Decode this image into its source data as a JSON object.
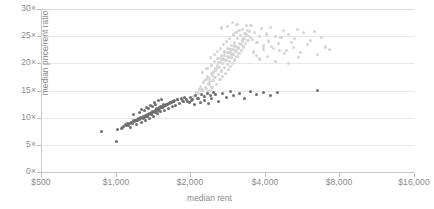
{
  "chart_data": {
    "type": "scatter",
    "title": "",
    "xlabel": "median rent",
    "ylabel": "median price/rent ratio",
    "xscale": "log2",
    "xlim": [
      500,
      16000
    ],
    "ylim": [
      0,
      30
    ],
    "xticks": [
      500,
      1000,
      2000,
      4000,
      8000,
      16000
    ],
    "xtick_labels": [
      "$500",
      "$1,000",
      "$2,000",
      "$4,000",
      "$8,000",
      "$16,000"
    ],
    "yticks": [
      0,
      5,
      10,
      15,
      20,
      25,
      30
    ],
    "ytick_labels": [
      "0×",
      "5×",
      "10×",
      "15×",
      "20×",
      "25×",
      "30×"
    ],
    "grid": true,
    "legend": "none",
    "colors": {
      "light_series": "#d5d5d5",
      "dark_series": "#6f6f6f",
      "grid": "#e8e8e8",
      "axis": "#c9c9c9",
      "text": "#8a8a8a"
    },
    "series": [
      {
        "name": "light-series",
        "color": "#d5d5d5",
        "points": [
          [
            2150,
            14.4
          ],
          [
            2230,
            15.1
          ],
          [
            2300,
            15.6
          ],
          [
            2380,
            16.2
          ],
          [
            2420,
            15.0
          ],
          [
            2470,
            16.8
          ],
          [
            2520,
            17.4
          ],
          [
            2560,
            16.1
          ],
          [
            2600,
            18.0
          ],
          [
            2640,
            17.0
          ],
          [
            2680,
            18.6
          ],
          [
            2710,
            17.6
          ],
          [
            2750,
            19.2
          ],
          [
            2780,
            18.2
          ],
          [
            2820,
            19.8
          ],
          [
            2850,
            18.8
          ],
          [
            2880,
            20.4
          ],
          [
            2910,
            19.4
          ],
          [
            2940,
            21.0
          ],
          [
            2970,
            20.0
          ],
          [
            3000,
            21.6
          ],
          [
            3030,
            20.6
          ],
          [
            3060,
            22.2
          ],
          [
            3090,
            21.2
          ],
          [
            3120,
            22.8
          ],
          [
            3150,
            21.8
          ],
          [
            3180,
            23.4
          ],
          [
            3210,
            22.4
          ],
          [
            3240,
            24.0
          ],
          [
            3270,
            23.0
          ],
          [
            3300,
            24.6
          ],
          [
            3340,
            23.6
          ],
          [
            3380,
            25.2
          ],
          [
            3420,
            24.2
          ],
          [
            3460,
            25.8
          ],
          [
            3500,
            24.8
          ],
          [
            2280,
            16.9
          ],
          [
            2350,
            17.5
          ],
          [
            2440,
            18.1
          ],
          [
            2530,
            18.7
          ],
          [
            2620,
            19.3
          ],
          [
            2700,
            19.9
          ],
          [
            2790,
            20.5
          ],
          [
            2870,
            21.1
          ],
          [
            2950,
            21.7
          ],
          [
            3040,
            22.3
          ],
          [
            3130,
            22.9
          ],
          [
            3220,
            23.5
          ],
          [
            2200,
            15.8
          ],
          [
            2260,
            16.4
          ],
          [
            2330,
            17.0
          ],
          [
            2400,
            17.2
          ],
          [
            2460,
            17.8
          ],
          [
            2540,
            19.0
          ],
          [
            2610,
            20.2
          ],
          [
            2690,
            20.8
          ],
          [
            2760,
            21.4
          ],
          [
            2840,
            22.0
          ],
          [
            2920,
            22.6
          ],
          [
            3010,
            23.2
          ],
          [
            2320,
            15.4
          ],
          [
            2390,
            16.6
          ],
          [
            2480,
            18.4
          ],
          [
            2570,
            19.6
          ],
          [
            2660,
            20.1
          ],
          [
            2740,
            20.7
          ],
          [
            2830,
            21.3
          ],
          [
            2900,
            21.9
          ],
          [
            2990,
            22.5
          ],
          [
            3070,
            23.1
          ],
          [
            3160,
            23.7
          ],
          [
            3250,
            24.3
          ],
          [
            2250,
            18.3
          ],
          [
            2340,
            19.1
          ],
          [
            2430,
            19.7
          ],
          [
            2510,
            20.3
          ],
          [
            2590,
            20.9
          ],
          [
            2670,
            21.5
          ],
          [
            2760,
            22.1
          ],
          [
            2840,
            22.7
          ],
          [
            2930,
            23.3
          ],
          [
            3020,
            23.9
          ],
          [
            3110,
            24.5
          ],
          [
            3200,
            25.1
          ],
          [
            2410,
            21.0
          ],
          [
            2500,
            21.6
          ],
          [
            2580,
            22.2
          ],
          [
            2650,
            22.8
          ],
          [
            2730,
            23.4
          ],
          [
            2810,
            24.0
          ],
          [
            2890,
            24.6
          ],
          [
            2980,
            25.2
          ],
          [
            3060,
            25.7
          ],
          [
            3150,
            26.0
          ],
          [
            3240,
            26.3
          ],
          [
            3330,
            25.5
          ],
          [
            3400,
            26.1
          ],
          [
            3480,
            25.0
          ],
          [
            3560,
            24.4
          ],
          [
            3640,
            25.6
          ],
          [
            3720,
            23.8
          ],
          [
            3800,
            24.9
          ],
          [
            3880,
            26.4
          ],
          [
            3960,
            23.2
          ],
          [
            4050,
            25.4
          ],
          [
            4140,
            24.1
          ],
          [
            4230,
            26.6
          ],
          [
            4330,
            22.8
          ],
          [
            4430,
            25.0
          ],
          [
            4540,
            23.6
          ],
          [
            4650,
            24.7
          ],
          [
            4760,
            26.0
          ],
          [
            4880,
            22.4
          ],
          [
            5000,
            25.3
          ],
          [
            5130,
            23.9
          ],
          [
            5270,
            24.5
          ],
          [
            5420,
            26.2
          ],
          [
            5580,
            22.0
          ],
          [
            5750,
            25.7
          ],
          [
            5930,
            23.4
          ],
          [
            6120,
            24.2
          ],
          [
            6330,
            25.9
          ],
          [
            6550,
            21.6
          ],
          [
            6790,
            24.8
          ],
          [
            7050,
            23.0
          ],
          [
            7300,
            22.5
          ],
          [
            3590,
            22.1
          ],
          [
            3700,
            21.5
          ],
          [
            3820,
            20.8
          ],
          [
            3950,
            22.6
          ],
          [
            4100,
            21.2
          ],
          [
            4260,
            23.1
          ],
          [
            4420,
            20.4
          ],
          [
            4600,
            22.3
          ],
          [
            4790,
            21.8
          ],
          [
            5000,
            20.0
          ],
          [
            5220,
            22.9
          ],
          [
            5460,
            21.0
          ],
          [
            2820,
            26.8
          ],
          [
            3090,
            27.2
          ],
          [
            3370,
            26.9
          ],
          [
            2960,
            27.5
          ],
          [
            3520,
            27.0
          ],
          [
            2680,
            26.5
          ],
          [
            2060,
            13.9
          ],
          [
            2120,
            14.6
          ],
          [
            2180,
            15.2
          ],
          [
            2270,
            14.1
          ],
          [
            2360,
            14.8
          ],
          [
            2450,
            15.5
          ]
        ]
      },
      {
        "name": "dark-series",
        "color": "#6f6f6f",
        "points": [
          [
            880,
            7.5
          ],
          [
            1010,
            5.6
          ],
          [
            1080,
            8.4
          ],
          [
            1120,
            9.0
          ],
          [
            1150,
            8.1
          ],
          [
            1180,
            9.4
          ],
          [
            1210,
            8.7
          ],
          [
            1240,
            9.8
          ],
          [
            1270,
            9.1
          ],
          [
            1300,
            10.2
          ],
          [
            1320,
            9.5
          ],
          [
            1350,
            10.6
          ],
          [
            1370,
            9.9
          ],
          [
            1400,
            11.0
          ],
          [
            1420,
            10.3
          ],
          [
            1450,
            11.4
          ],
          [
            1470,
            10.7
          ],
          [
            1500,
            11.8
          ],
          [
            1520,
            11.1
          ],
          [
            1550,
            12.1
          ],
          [
            1580,
            11.4
          ],
          [
            1600,
            12.4
          ],
          [
            1630,
            11.7
          ],
          [
            1660,
            12.7
          ],
          [
            1690,
            12.0
          ],
          [
            1720,
            13.0
          ],
          [
            1750,
            12.3
          ],
          [
            1780,
            13.3
          ],
          [
            1810,
            12.6
          ],
          [
            1840,
            13.5
          ],
          [
            1100,
            8.8
          ],
          [
            1160,
            9.2
          ],
          [
            1220,
            9.6
          ],
          [
            1280,
            10.0
          ],
          [
            1340,
            10.4
          ],
          [
            1390,
            10.8
          ],
          [
            1440,
            11.2
          ],
          [
            1490,
            11.6
          ],
          [
            1540,
            12.0
          ],
          [
            1590,
            12.3
          ],
          [
            1640,
            12.6
          ],
          [
            1700,
            12.9
          ],
          [
            1130,
            8.5
          ],
          [
            1190,
            9.3
          ],
          [
            1250,
            9.7
          ],
          [
            1310,
            10.1
          ],
          [
            1360,
            10.5
          ],
          [
            1410,
            10.9
          ],
          [
            1460,
            11.3
          ],
          [
            1510,
            11.7
          ],
          [
            1560,
            12.1
          ],
          [
            1610,
            12.5
          ],
          [
            1670,
            12.8
          ],
          [
            1730,
            13.1
          ],
          [
            1060,
            8.0
          ],
          [
            1140,
            8.9
          ],
          [
            1200,
            9.5
          ],
          [
            1260,
            9.9
          ],
          [
            1330,
            10.3
          ],
          [
            1380,
            10.7
          ],
          [
            1430,
            11.1
          ],
          [
            1480,
            11.5
          ],
          [
            1530,
            11.9
          ],
          [
            1570,
            12.2
          ],
          [
            1620,
            12.5
          ],
          [
            1680,
            12.8
          ],
          [
            1170,
            9.0
          ],
          [
            1230,
            9.4
          ],
          [
            1290,
            9.8
          ],
          [
            1345,
            10.2
          ],
          [
            1395,
            10.6
          ],
          [
            1445,
            11.0
          ],
          [
            1495,
            11.4
          ],
          [
            1545,
            11.8
          ],
          [
            1595,
            12.2
          ],
          [
            1655,
            12.6
          ],
          [
            1715,
            13.0
          ],
          [
            1775,
            13.4
          ],
          [
            1860,
            13.2
          ],
          [
            1900,
            13.7
          ],
          [
            1950,
            13.0
          ],
          [
            2000,
            13.8
          ],
          [
            2050,
            13.4
          ],
          [
            2100,
            14.0
          ],
          [
            2160,
            13.6
          ],
          [
            2220,
            14.2
          ],
          [
            2290,
            13.9
          ],
          [
            2350,
            14.4
          ],
          [
            2420,
            14.0
          ],
          [
            2490,
            14.6
          ],
          [
            1880,
            12.9
          ],
          [
            1930,
            13.3
          ],
          [
            1980,
            12.7
          ],
          [
            2030,
            13.1
          ],
          [
            2080,
            12.5
          ],
          [
            2140,
            13.5
          ],
          [
            2210,
            12.8
          ],
          [
            2280,
            13.2
          ],
          [
            2360,
            12.6
          ],
          [
            2440,
            13.6
          ],
          [
            2520,
            14.2
          ],
          [
            2600,
            13.0
          ],
          [
            2700,
            14.4
          ],
          [
            2800,
            13.8
          ],
          [
            2900,
            14.8
          ],
          [
            3000,
            14.0
          ],
          [
            3150,
            14.5
          ],
          [
            3300,
            13.6
          ],
          [
            3500,
            14.9
          ],
          [
            3700,
            14.2
          ],
          [
            3950,
            14.6
          ],
          [
            4200,
            14.1
          ],
          [
            4500,
            14.7
          ],
          [
            6500,
            15.0
          ],
          [
            1020,
            7.8
          ],
          [
            1070,
            8.2
          ],
          [
            1110,
            8.6
          ],
          [
            1155,
            9.1
          ],
          [
            1205,
            9.5
          ],
          [
            1265,
            10.0
          ],
          [
            1315,
            10.4
          ],
          [
            1365,
            10.8
          ],
          [
            1415,
            11.2
          ],
          [
            1465,
            11.6
          ],
          [
            1515,
            12.0
          ],
          [
            1565,
            12.4
          ],
          [
            1275,
            11.5
          ],
          [
            1335,
            11.9
          ],
          [
            1385,
            12.3
          ],
          [
            1435,
            12.7
          ],
          [
            1485,
            13.1
          ],
          [
            1535,
            13.4
          ],
          [
            1185,
            10.6
          ],
          [
            1245,
            11.0
          ],
          [
            1305,
            11.3
          ],
          [
            1355,
            11.7
          ],
          [
            1405,
            12.1
          ],
          [
            1455,
            12.5
          ]
        ]
      }
    ]
  }
}
